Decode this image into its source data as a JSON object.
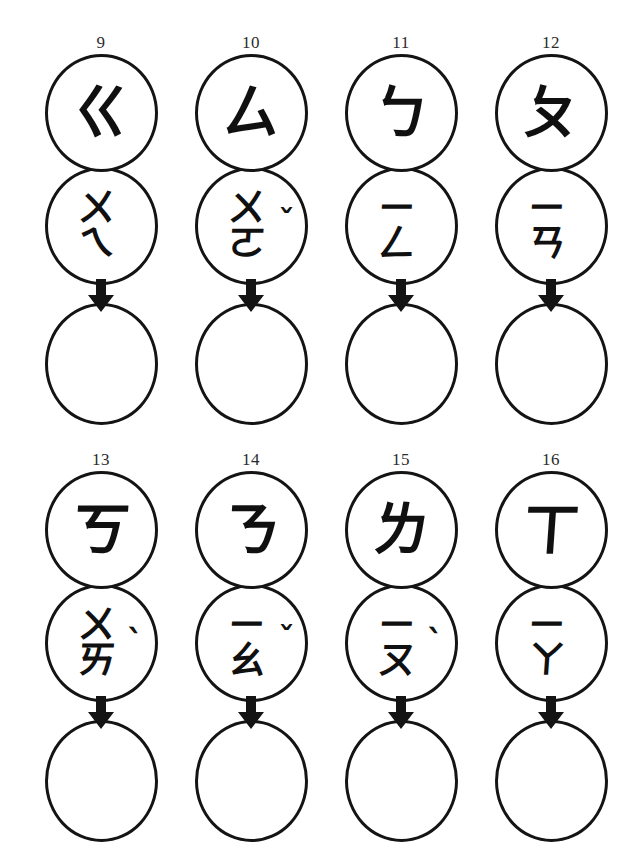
{
  "worksheet": {
    "title": "Zhuyin (Bopomofo) spelling worksheet",
    "arrow_icon": "down-arrow-icon",
    "ink_color": "#101010",
    "background_color": "#ffffff",
    "rows": [
      {
        "row_label": "top-row",
        "items": [
          {
            "number": "9",
            "initial": "ㄍ",
            "final_top": "ㄨ",
            "final_bottom": "ㄟ",
            "final_single": "",
            "tone": "",
            "tone_class": "empty",
            "answer": ""
          },
          {
            "number": "10",
            "initial": "ㄙ",
            "final_top": "ㄨ",
            "final_bottom": "ㄛ",
            "final_single": "",
            "tone": "ˇ",
            "tone_class": "tone-3",
            "answer": ""
          },
          {
            "number": "11",
            "initial": "ㄅ",
            "final_top": "ㄧ",
            "final_bottom": "ㄥ",
            "final_single": "",
            "tone": "",
            "tone_class": "empty",
            "answer": ""
          },
          {
            "number": "12",
            "initial": "ㄆ",
            "final_top": "ㄧ",
            "final_bottom": "ㄢ",
            "final_single": "",
            "tone": "",
            "tone_class": "empty",
            "answer": ""
          }
        ]
      },
      {
        "row_label": "bottom-row",
        "items": [
          {
            "number": "13",
            "initial": "ㄎ",
            "final_top": "ㄨ",
            "final_bottom": "ㄞ",
            "final_single": "",
            "tone": "ˋ",
            "tone_class": "tone-4",
            "answer": ""
          },
          {
            "number": "14",
            "initial": "ㄋ",
            "final_top": "ㄧ",
            "final_bottom": "ㄠ",
            "final_single": "",
            "tone": "ˇ",
            "tone_class": "tone-3",
            "answer": ""
          },
          {
            "number": "15",
            "initial": "ㄌ",
            "final_top": "ㄧ",
            "final_bottom": "ㄡ",
            "final_single": "",
            "tone": "ˋ",
            "tone_class": "tone-4",
            "answer": ""
          },
          {
            "number": "16",
            "initial": "ㄒ",
            "final_top": "ㄧ",
            "final_bottom": "ㄚ",
            "final_single": "",
            "tone": "",
            "tone_class": "empty",
            "answer": ""
          }
        ]
      }
    ]
  }
}
